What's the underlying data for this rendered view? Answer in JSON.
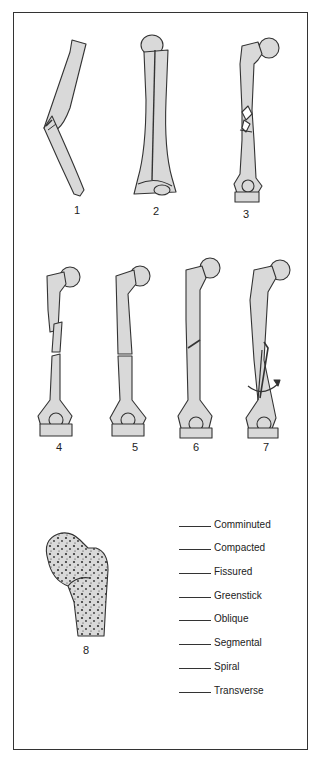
{
  "figure": {
    "caption_fragment": "",
    "panels": [
      {
        "id": 1,
        "label": "1",
        "description": "bent long bone, incomplete fracture on convex side"
      },
      {
        "id": 2,
        "label": "2",
        "description": "humerus with longitudinal crack along shaft"
      },
      {
        "id": 3,
        "label": "3",
        "description": "femur with multiple fragments at midshaft"
      },
      {
        "id": 4,
        "label": "4",
        "description": "femur with separate middle segment between two breaks"
      },
      {
        "id": 5,
        "label": "5",
        "description": "femur with straight horizontal break"
      },
      {
        "id": 6,
        "label": "6",
        "description": "femur with angled break across shaft"
      },
      {
        "id": 7,
        "label": "7",
        "description": "femur with twisting break and rotation arrow"
      },
      {
        "id": 8,
        "label": "8",
        "description": "proximal femur with bone ends pushed into each other (cancellous texture)"
      }
    ],
    "terms_list": [
      {
        "blank": "______",
        "label": "Comminuted"
      },
      {
        "blank": "______",
        "label": "Compacted"
      },
      {
        "blank": "______",
        "label": "Fissured"
      },
      {
        "blank": "______",
        "label": "Greenstick"
      },
      {
        "blank": "______",
        "label": "Oblique"
      },
      {
        "blank": "______",
        "label": "Segmental"
      },
      {
        "blank": "______",
        "label": "Spiral"
      },
      {
        "blank": "______",
        "label": "Transverse"
      }
    ]
  },
  "colors": {
    "bone_fill": "#d9d9d9",
    "outline": "#333333",
    "frame": "#333333"
  }
}
